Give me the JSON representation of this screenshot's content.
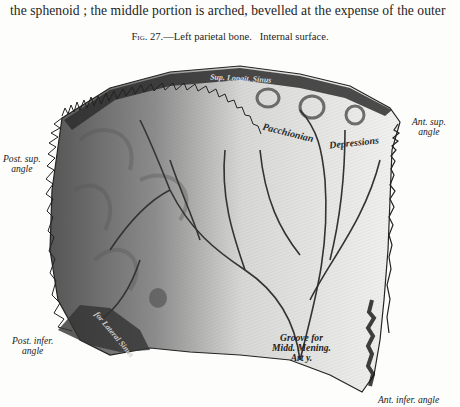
{
  "page": {
    "body_text_line": "the sphenoid ; the middle portion is arched, bevelled at the expense of the outer",
    "caption": {
      "figure_number": "Fig. 27.",
      "dash": "—",
      "title": "Left parietal bone.",
      "subtitle": "Internal surface."
    }
  },
  "figure": {
    "colors": {
      "ink": "#1e1e1e",
      "paper": "#fdfdfb",
      "bone_dark": "#3c3c3c",
      "bone_mid": "#8a8a8a",
      "bone_light": "#e4e4e2"
    },
    "angle_labels": {
      "post_sup": {
        "line1": "Post. sup.",
        "line2": "angle"
      },
      "ant_sup": {
        "line1": "Ant. sup.",
        "line2": "angle"
      },
      "post_infer": {
        "line1": "Post. infer.",
        "line2": "angle"
      },
      "ant_infer": {
        "line1": "Ant. infer. angle"
      }
    },
    "inner_labels": {
      "sup_longit_sinus": "Sup. Longit. Sinus",
      "pacchionian": "Pacchionian",
      "depressions": "Depressions",
      "lat_sinus": "for Lateral Sinus",
      "groove": {
        "line1": "Groove for",
        "line2": "Midd. Mening.",
        "line3": "Art y."
      }
    }
  }
}
